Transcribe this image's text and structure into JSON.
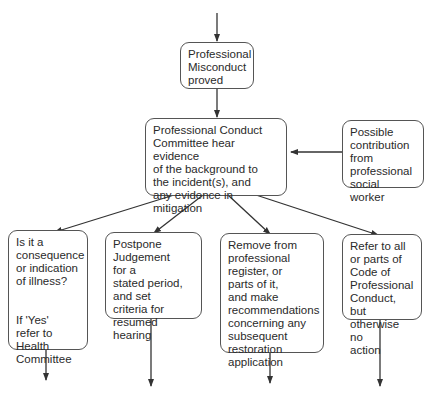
{
  "diagram": {
    "nodes": {
      "misconduct": "Professional\nMisconduct\nproved",
      "committee": "Professional Conduct\nCommittee hear evidence\nof the background to\nthe incident(s), and\nany evidence in\nmitigation",
      "social_worker": "Possible\ncontribution\nfrom\nprofessional\nsocial worker",
      "illness": "Is it a\nconsequence\nor indication\nof illness?\n\n\nIf 'Yes'\nrefer to\nHealth\nCommittee",
      "postpone": "Postpone\nJudgement\nfor a\nstated period,\nand set\ncriteria for\nresumed hearing",
      "remove": "Remove from\nprofessional\nregister, or\nparts of it,\nand make\nrecommendations\nconcerning any\nsubsequent\nrestoration\napplication",
      "refer_code": "Refer to all\nor parts of\nCode of\nProfessional\nConduct, but\notherwise no\naction"
    },
    "edges": [
      {
        "from": "entry",
        "to": "misconduct"
      },
      {
        "from": "misconduct",
        "to": "committee"
      },
      {
        "from": "social_worker",
        "to": "committee"
      },
      {
        "from": "committee",
        "to": "illness"
      },
      {
        "from": "committee",
        "to": "postpone"
      },
      {
        "from": "committee",
        "to": "remove"
      },
      {
        "from": "committee",
        "to": "refer_code"
      },
      {
        "from": "illness",
        "to": "exit"
      },
      {
        "from": "postpone",
        "to": "exit"
      },
      {
        "from": "remove",
        "to": "exit"
      },
      {
        "from": "refer_code",
        "to": "exit"
      }
    ]
  }
}
